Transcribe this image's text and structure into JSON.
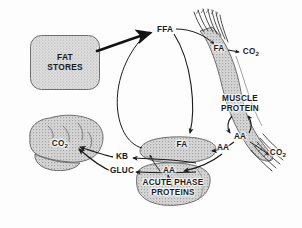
{
  "figure": {
    "kind": "metabolic-flow-diagram",
    "background_color": "#fdfdfd",
    "line_color": "#1b1b1b",
    "organ_fill": "#c9c9c9",
    "box_fill": "#d2d2d2"
  },
  "nodes": {
    "fat_stores": {
      "label_line1": "FAT",
      "label_line2": "STORES",
      "shape": "rounded-box"
    },
    "muscle": {
      "label_line1": "MUSCLE",
      "label_line2": "PROTEIN",
      "shape": "muscle"
    },
    "liver": {
      "label_line1": "ACUTE  PHASE",
      "label_line2": "PROTEINS",
      "shape": "liver"
    },
    "brain": {
      "shape": "brain"
    },
    "gut": {
      "shape": "oval"
    }
  },
  "metabolites": {
    "ffa": "FFA",
    "fa_muscle": "FA",
    "co2_muscle": "CO",
    "co2_muscle_sub": "2",
    "aa_muscle": "AA",
    "co2_muscle_lower": "CO",
    "co2_muscle_lower_sub": "2",
    "fa_liver": "FA",
    "aa_liver_in": "AA",
    "aa_liver": "AA",
    "kb": "KB",
    "gluc": "GLUC",
    "co2_brain": "CO",
    "co2_brain_sub": "2"
  }
}
